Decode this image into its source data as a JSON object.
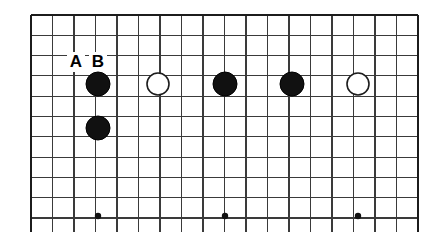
{
  "figure": {
    "kind": "go-board-diagram",
    "background_color": "#ffffff",
    "board": {
      "left": 31,
      "top": 15,
      "right": 418,
      "bottom": 218,
      "bottom_stub": 232,
      "cell_width": 21.5,
      "cell_height": 20.3,
      "columns": 19,
      "rows": 11,
      "line_color": "#3a3a3a",
      "border_color": "#1c1c1c"
    },
    "stones": [
      {
        "id": "stone-b1",
        "color": "black",
        "color_hex": "#111111",
        "cx": 98,
        "cy": 84,
        "r": 12
      },
      {
        "id": "stone-w1",
        "color": "white",
        "color_hex": "#ffffff",
        "cx": 158,
        "cy": 84,
        "r": 11
      },
      {
        "id": "stone-b2",
        "color": "black",
        "color_hex": "#111111",
        "cx": 225,
        "cy": 84,
        "r": 12
      },
      {
        "id": "stone-b3",
        "color": "black",
        "color_hex": "#111111",
        "cx": 292,
        "cy": 84,
        "r": 12
      },
      {
        "id": "stone-w2",
        "color": "white",
        "color_hex": "#ffffff",
        "cx": 358,
        "cy": 84,
        "r": 11
      },
      {
        "id": "stone-b4",
        "color": "black",
        "color_hex": "#111111",
        "cx": 98,
        "cy": 128,
        "r": 12
      }
    ],
    "star_points": [
      {
        "id": "star-1",
        "cx": 98,
        "cy": 216,
        "r": 3.2
      },
      {
        "id": "star-2",
        "cx": 225,
        "cy": 216,
        "r": 3.2
      },
      {
        "id": "star-3",
        "cx": 358,
        "cy": 216,
        "r": 3.2
      }
    ],
    "labels": [
      {
        "id": "label-a",
        "text": "A",
        "x": 76,
        "y": 62
      },
      {
        "id": "label-b",
        "text": "B",
        "x": 98,
        "y": 62
      }
    ]
  },
  "chart_data": {
    "type": "table",
    "xlabel": "",
    "ylabel": "",
    "categories": [
      "A",
      "B",
      "stone-b1",
      "stone-w1",
      "stone-b2",
      "stone-b3",
      "stone-w2",
      "stone-b4"
    ],
    "values": [
      62,
      62,
      84,
      84,
      84,
      84,
      84,
      128
    ],
    "annotations": [
      "A",
      "B"
    ],
    "legend": [
      "black stone",
      "white stone",
      "star point"
    ]
  }
}
